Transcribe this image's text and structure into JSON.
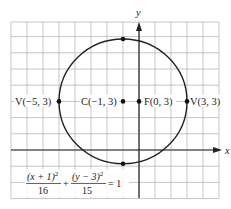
{
  "figure": {
    "axes": {
      "x_label": "x",
      "y_label": "y"
    },
    "grid": {
      "x_min": -8,
      "x_max": 5,
      "y_min": -3,
      "y_max": 8,
      "cell_units": 1
    },
    "ellipse": {
      "center": [
        -1,
        3
      ],
      "a_squared": 16,
      "b_squared": 15,
      "color": "#222222"
    },
    "points": [
      {
        "id": "V1",
        "label": "V(−5, 3)",
        "x": -5,
        "y": 3
      },
      {
        "id": "C",
        "label": "C(−1, 3)",
        "x": -1,
        "y": 3
      },
      {
        "id": "F",
        "label": "F(0, 3)",
        "x": 0,
        "y": 3
      },
      {
        "id": "V2",
        "label": "V(3, 3)",
        "x": 3,
        "y": 3
      },
      {
        "id": "top",
        "label": "",
        "x": -1,
        "y": 6.87
      },
      {
        "id": "bottom",
        "label": "",
        "x": -1,
        "y": -0.87
      }
    ],
    "equation": {
      "num1": "(x + 1)",
      "num1_exp": "2",
      "den1": "16",
      "plus": "+",
      "num2": "(y − 3)",
      "num2_exp": "2",
      "den2": "15",
      "equals": "= 1"
    }
  },
  "labels": {
    "v1": "V(−5, 3)",
    "c": "C(−1, 3)",
    "f": "F(0, 3)",
    "v2": "V(3, 3)",
    "x_axis": "x",
    "y_axis": "y"
  }
}
